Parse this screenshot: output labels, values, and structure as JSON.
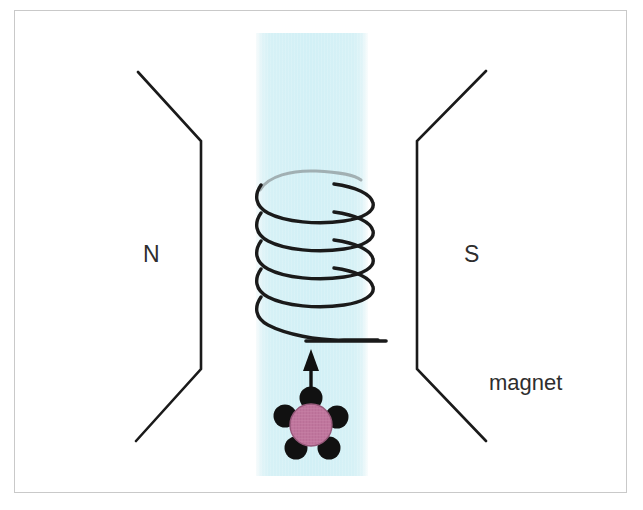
{
  "figure": {
    "background_color": "#ffffff",
    "frame_border_color": "#c9c9c9"
  },
  "labels": {
    "north_pole": "N",
    "south_pole": "S",
    "magnet": "magnet"
  },
  "field_band": {
    "name": "magnetic-field-region",
    "color": "#d2f0f6",
    "x": 256,
    "y": 33,
    "width": 112,
    "height": 443
  },
  "poles": {
    "color": "#1a1a1a",
    "stroke_width": 2.6,
    "left": {
      "name": "north-pole-piece",
      "points": "138,72 201,141 201,369 136,441"
    },
    "right": {
      "name": "south-pole-piece",
      "points": "486,71 417,141 417,369 486,441"
    }
  },
  "coil": {
    "name": "helical-coil",
    "color": "#1a1a1a",
    "stroke_width": 3.4,
    "turns": 5,
    "center_x": 311,
    "radius_x": 62,
    "radius_y": 15,
    "top_y": 178,
    "pitch": 28,
    "lead_wire": {
      "name": "coil-lead-wire",
      "x1": 306,
      "x2": 386,
      "y": 341
    }
  },
  "arrow": {
    "name": "velocity-arrow",
    "color": "#111111",
    "x": 311,
    "tail_y": 397,
    "head_y": 350,
    "stroke_width": 3.4,
    "head_width": 16,
    "head_length": 20
  },
  "particle": {
    "name": "charged-particle",
    "body_color": "#c0769d",
    "body_stroke": "#8e5677",
    "dot_color": "#111111",
    "center_x": 311,
    "center_y": 425,
    "body_radius": 21,
    "dot_radius": 11,
    "dot_count": 5,
    "dot_positions": [
      {
        "x": 311,
        "y": 398
      },
      {
        "x": 285,
        "y": 416
      },
      {
        "x": 337,
        "y": 416
      },
      {
        "x": 295,
        "y": 447
      },
      {
        "x": 328,
        "y": 447
      }
    ]
  }
}
